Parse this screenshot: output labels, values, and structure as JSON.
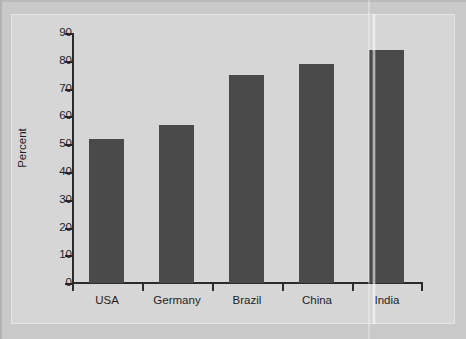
{
  "chart_data": {
    "type": "bar",
    "title": "",
    "subtitle": "",
    "xlabel": "",
    "ylabel": "Percent",
    "categories": [
      "USA",
      "Germany",
      "Brazil",
      "China",
      "India"
    ],
    "values": [
      52,
      57,
      75,
      79,
      84
    ],
    "ylim": [
      0,
      90
    ],
    "ytick_labels": [
      "0",
      "10",
      "20",
      "30",
      "40",
      "50",
      "60",
      "70",
      "80",
      "90"
    ],
    "ytick_values": [
      0,
      10,
      20,
      30,
      40,
      50,
      60,
      70,
      80,
      90
    ],
    "grid": false,
    "legend": null,
    "legend_position": "none",
    "series": [
      {
        "name": "Percent",
        "values": [
          52,
          57,
          75,
          79,
          84
        ]
      }
    ],
    "annotations": []
  },
  "colors": {
    "bar_fill": "#4a4a4a",
    "axis": "#2b2b2b",
    "plot_background": "#d6d6d6",
    "page_background": "#c9c9c9",
    "text": "#1f1f1f"
  }
}
